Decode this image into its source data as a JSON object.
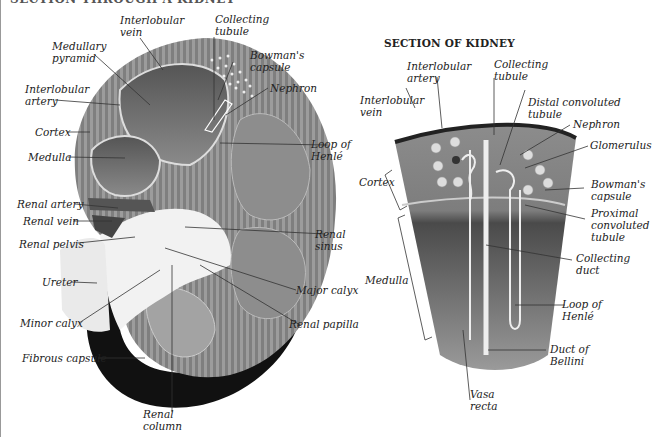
{
  "header": {
    "title_cut": "SECTION THROUGH A KIDNEY"
  },
  "left_figure": {
    "labels": {
      "interlobular_vein": "Interlobular\nvein",
      "collecting_tubule": "Collecting\ntubule",
      "medullary_pyramid": "Medullary\npyramid",
      "bowmans_capsule": "Bowman's\ncapsule",
      "interlobular_artery": "Interlobular\nartery",
      "nephron": "Nephron",
      "cortex": "Cortex",
      "medulla": "Medulla",
      "loop_of_henle": "Loop of\nHenlé",
      "renal_artery": "Renal artery",
      "renal_vein": "Renal vein",
      "renal_sinus": "Renal\nsinus",
      "renal_pelvis": "Renal pelvis",
      "ureter": "Ureter",
      "major_calyx": "Major calyx",
      "minor_calyx": "Minor calyx",
      "renal_papilla": "Renal papilla",
      "fibrous_capsule": "Fibrous capsule",
      "renal_column": "Renal\ncolumn"
    }
  },
  "right_figure": {
    "title": "SECTION OF KIDNEY",
    "labels": {
      "interlobular_artery": "Interlobular\nartery",
      "collecting_tubule": "Collecting\ntubule",
      "interlobular_vein": "Interlobular\nvein",
      "distal_convoluted_tubule": "Distal convoluted\ntubule",
      "nephron": "Nephron",
      "glomerulus": "Glomerulus",
      "cortex": "Cortex",
      "bowmans_capsule": "Bowman's\ncapsule",
      "proximal_convoluted_tubule": "Proximal\nconvoluted\ntubule",
      "collecting_duct": "Collecting\nduct",
      "medulla": "Medulla",
      "loop_of_henle": "Loop of\nHenlé",
      "duct_of_bellini": "Duct of\nBellini",
      "vasa_recta": "Vasa\nrecta"
    }
  },
  "colors": {
    "tissue_dark": "#3a3a3a",
    "tissue_mid": "#7a7a7a",
    "tissue_light": "#b8b8b8",
    "capsule": "#111111",
    "pelvis": "#f2f2f2",
    "leader": "#333333"
  }
}
